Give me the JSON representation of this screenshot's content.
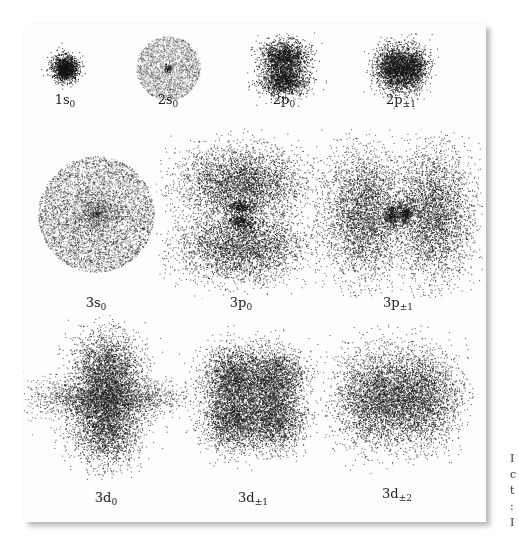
{
  "figure": {
    "orbitals": [
      {
        "id": "1s0",
        "n": 1,
        "l": "s",
        "m": "0",
        "label_main": "1s",
        "label_sub": "0",
        "shape": "sphere-small",
        "cx": 65,
        "cy": 68,
        "r": 14,
        "label_y": 92
      },
      {
        "id": "2s0",
        "n": 2,
        "l": "s",
        "m": "0",
        "label_main": "2s",
        "label_sub": "0",
        "shape": "sphere-node",
        "cx": 168,
        "cy": 68,
        "r": 32,
        "label_y": 92
      },
      {
        "id": "2p0",
        "n": 2,
        "l": "p",
        "m": "0",
        "label_main": "2p",
        "label_sub": "0",
        "shape": "p-vertical",
        "cx": 284,
        "cy": 68,
        "r": 28,
        "label_y": 92
      },
      {
        "id": "2p+-1",
        "n": 2,
        "l": "p",
        "m": "±1",
        "label_main": "2p",
        "label_sub": "±1",
        "shape": "p-horizontal",
        "cx": 401,
        "cy": 68,
        "r": 28,
        "label_y": 92
      },
      {
        "id": "3s0",
        "n": 3,
        "l": "s",
        "m": "0",
        "label_main": "3s",
        "label_sub": "0",
        "shape": "sphere-large",
        "cx": 96,
        "cy": 214,
        "r": 58,
        "label_y": 295
      },
      {
        "id": "3p0",
        "n": 3,
        "l": "p",
        "m": "0",
        "label_main": "3p",
        "label_sub": "0",
        "shape": "3p-vertical",
        "cx": 241,
        "cy": 214,
        "r": 70,
        "label_y": 295
      },
      {
        "id": "3p+-1",
        "n": 3,
        "l": "p",
        "m": "±1",
        "label_main": "3p",
        "label_sub": "±1",
        "shape": "3p-horizontal",
        "cx": 398,
        "cy": 214,
        "r": 70,
        "label_y": 295
      },
      {
        "id": "3d0",
        "n": 3,
        "l": "d",
        "m": "0",
        "label_main": "3d",
        "label_sub": "0",
        "shape": "d-zero",
        "cx": 106,
        "cy": 398,
        "r": 68,
        "label_y": 490
      },
      {
        "id": "3d+-1",
        "n": 3,
        "l": "d",
        "m": "±1",
        "label_main": "3d",
        "label_sub": "±1",
        "shape": "d-clover",
        "cx": 253,
        "cy": 398,
        "r": 62,
        "label_y": 490
      },
      {
        "id": "3d+-2",
        "n": 3,
        "l": "d",
        "m": "±2",
        "label_main": "3d",
        "label_sub": "±2",
        "shape": "d-two-lobe",
        "cx": 397,
        "cy": 398,
        "r": 62,
        "label_y": 486
      }
    ]
  },
  "side_text": [
    "I",
    "c",
    "t",
    ":",
    "I"
  ],
  "colors": {
    "ink": "#1a1a1a",
    "panel": "#fdfdfd",
    "shadow": "#9a9a9a"
  }
}
